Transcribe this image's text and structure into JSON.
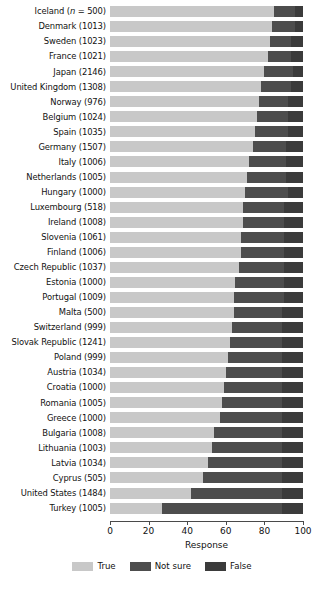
{
  "chart_data": {
    "type": "bar",
    "subtype": "horizontal-stacked-100pct",
    "title": "",
    "xlabel": "Response",
    "ylabel": "",
    "xlim": [
      0,
      100
    ],
    "xticks": [
      0,
      20,
      40,
      60,
      80,
      100
    ],
    "xtick_labels": [
      "0",
      "20",
      "40",
      "60",
      "80",
      "100"
    ],
    "grid": false,
    "legend_position": "bottom-center",
    "legend": [
      "True",
      "Not sure",
      "False"
    ],
    "colors": {
      "True": "#c8c8c8",
      "Not sure": "#4d4d4d",
      "False": "#3b3b3b"
    },
    "categories": [
      "Iceland (n = 500)",
      "Denmark (1013)",
      "Sweden (1023)",
      "France (1021)",
      "Japan (2146)",
      "United Kingdom (1308)",
      "Norway (976)",
      "Belgium (1024)",
      "Spain (1035)",
      "Germany (1507)",
      "Italy (1006)",
      "Netherlands (1005)",
      "Hungary (1000)",
      "Luxembourg (518)",
      "Ireland (1008)",
      "Slovenia (1061)",
      "Finland (1006)",
      "Czech Republic (1037)",
      "Estonia (1000)",
      "Portugal (1009)",
      "Malta (500)",
      "Switzerland (999)",
      "Slovak Republic (1241)",
      "Poland (999)",
      "Austria (1034)",
      "Croatia (1000)",
      "Romania (1005)",
      "Greece (1000)",
      "Bulgaria (1008)",
      "Lithuania (1003)",
      "Latvia (1034)",
      "Cyprus (505)",
      "United States (1484)",
      "Turkey (1005)"
    ],
    "series": [
      {
        "name": "True",
        "values": [
          85,
          84,
          83,
          82,
          80,
          78,
          77,
          76,
          75,
          74,
          72,
          71,
          70,
          69,
          69,
          68,
          68,
          67,
          65,
          64,
          64,
          63,
          62,
          61,
          60,
          59,
          58,
          57,
          54,
          53,
          51,
          48,
          42,
          27
        ]
      },
      {
        "name": "Not sure",
        "values": [
          11,
          12,
          11,
          12,
          15,
          16,
          15,
          16,
          17,
          17,
          19,
          20,
          22,
          21,
          21,
          22,
          22,
          23,
          25,
          26,
          25,
          26,
          27,
          28,
          29,
          30,
          31,
          32,
          35,
          36,
          38,
          41,
          47,
          62
        ]
      },
      {
        "name": "False",
        "values": [
          4,
          4,
          6,
          6,
          5,
          6,
          8,
          8,
          8,
          9,
          9,
          9,
          8,
          10,
          10,
          10,
          10,
          10,
          10,
          10,
          11,
          11,
          11,
          11,
          11,
          11,
          11,
          11,
          11,
          11,
          11,
          11,
          11,
          11
        ]
      }
    ]
  },
  "axis": {
    "xlabel": "Response"
  },
  "legend": {
    "items": [
      {
        "label": "True",
        "swatch": "legend-swatch-true"
      },
      {
        "label": "Not sure",
        "swatch": "legend-swatch-not-sure"
      },
      {
        "label": "False",
        "swatch": "legend-swatch-false"
      }
    ]
  }
}
